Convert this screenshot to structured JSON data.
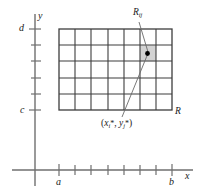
{
  "figure": {
    "type": "math-diagram",
    "axes": {
      "x_label": "x",
      "y_label": "y"
    },
    "bounds": {
      "x_min_label": "a",
      "x_max_label": "b",
      "y_min_label": "c",
      "y_max_label": "d"
    },
    "labels": {
      "region": "R",
      "subrectangle_letter": "R",
      "subrectangle_subscript": "ij",
      "sample_point_open": "(",
      "sample_point_x": "x",
      "sample_point_x_sub": "i",
      "sample_point_star1": "*",
      "sample_point_comma": ", ",
      "sample_point_y": "y",
      "sample_point_y_sub": "j",
      "sample_point_star2": "*",
      "sample_point_close": ")"
    },
    "colors": {
      "shaded_cell": "#d3d3d3",
      "grid_stroke": "#3d3d3d",
      "axis_stroke": "#6f6f6f",
      "dot": "#000000"
    },
    "grid": {
      "columns": 7,
      "rows": 5,
      "shaded_column_index": 5,
      "shaded_row_index": 1
    }
  }
}
